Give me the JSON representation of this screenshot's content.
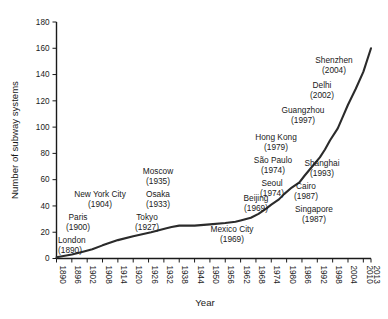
{
  "chart_data": {
    "type": "line",
    "title": "",
    "xlabel": "Year",
    "ylabel": "Number of subway systems",
    "xlim": [
      1890,
      2013
    ],
    "ylim": [
      0,
      180
    ],
    "grid": false,
    "legend": "none",
    "xticks": [
      "1890",
      "1896",
      "1902",
      "1908",
      "1914",
      "1920",
      "1926",
      "1932",
      "1938",
      "1944",
      "1950",
      "1956",
      "1962",
      "1968",
      "1974",
      "1980",
      "1986",
      "1992",
      "1998",
      "2004",
      "2010",
      "2013"
    ],
    "yticks": [
      "0",
      "20",
      "40",
      "60",
      "80",
      "100",
      "120",
      "140",
      "160",
      "180"
    ],
    "series": [
      {
        "name": "Cumulative subway systems",
        "x": [
          1890,
          1896,
          1900,
          1904,
          1908,
          1914,
          1920,
          1927,
          1933,
          1935,
          1938,
          1944,
          1950,
          1956,
          1960,
          1962,
          1966,
          1969,
          1972,
          1974,
          1977,
          1979,
          1982,
          1985,
          1987,
          1990,
          1993,
          1995,
          1997,
          2000,
          2002,
          2004,
          2007,
          2010,
          2013
        ],
        "y": [
          1,
          3,
          5,
          7,
          10,
          14,
          17,
          20,
          23,
          24,
          25,
          25,
          26,
          27,
          28,
          29,
          31,
          34,
          38,
          41,
          45,
          49,
          54,
          58,
          63,
          70,
          77,
          83,
          90,
          99,
          108,
          117,
          129,
          142,
          160
        ]
      }
    ],
    "annotations": [
      {
        "city": "London",
        "year": "(1890)",
        "x": 58,
        "y": 243,
        "align": "an-left"
      },
      {
        "city": "Paris",
        "year": "(1900)",
        "x": 78,
        "y": 220,
        "align": "an-mid"
      },
      {
        "city": "New York City",
        "year": "(1904)",
        "x": 100,
        "y": 197,
        "align": "an-mid"
      },
      {
        "city": "Tokyo",
        "year": "(1927)",
        "x": 147,
        "y": 220,
        "align": "an-mid"
      },
      {
        "city": "Osaka",
        "year": "(1933)",
        "x": 158,
        "y": 197,
        "align": "an-mid"
      },
      {
        "city": "Moscow",
        "year": "(1935)",
        "x": 158,
        "y": 174,
        "align": "an-mid"
      },
      {
        "city": "Mexico City",
        "year": "(1969)",
        "x": 232,
        "y": 232,
        "align": "an-mid"
      },
      {
        "city": "Beijing",
        "year": "(1969)",
        "x": 256,
        "y": 201,
        "align": "an-mid"
      },
      {
        "city": "Seoul",
        "year": "(1974)",
        "x": 272,
        "y": 186,
        "align": "an-mid"
      },
      {
        "city": "São Paulo",
        "year": "(1974)",
        "x": 273,
        "y": 163,
        "align": "an-mid"
      },
      {
        "city": "Hong Kong",
        "year": "(1979)",
        "x": 276,
        "y": 140,
        "align": "an-mid"
      },
      {
        "city": "Singapore",
        "year": "(1987)",
        "x": 314,
        "y": 212,
        "align": "an-mid"
      },
      {
        "city": "Cairo",
        "year": "(1987)",
        "x": 306,
        "y": 189,
        "align": "an-mid"
      },
      {
        "city": "Shanghai",
        "year": "(1993)",
        "x": 322,
        "y": 166,
        "align": "an-mid"
      },
      {
        "city": "Guangzhou",
        "year": "(1997)",
        "x": 303,
        "y": 113,
        "align": "an-mid"
      },
      {
        "city": "Delhi",
        "year": "(2002)",
        "x": 322,
        "y": 88,
        "align": "an-mid"
      },
      {
        "city": "Shenzhen",
        "year": "(2004)",
        "x": 334,
        "y": 63,
        "align": "an-mid"
      }
    ]
  }
}
